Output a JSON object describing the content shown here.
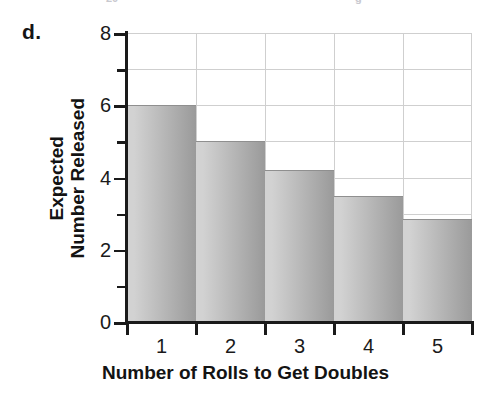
{
  "panel": {
    "label": "d."
  },
  "artifacts": {
    "left_fragment": "20",
    "right_fragment": "g"
  },
  "chart_data": {
    "type": "bar",
    "title": "",
    "subtitle": "",
    "categories": [
      "1",
      "2",
      "3",
      "4",
      "5"
    ],
    "values": [
      6.0,
      5.0,
      4.2,
      3.5,
      2.85
    ],
    "series": [
      {
        "name": "Expected Number Released",
        "values": [
          6.0,
          5.0,
          4.2,
          3.5,
          2.85
        ]
      }
    ],
    "xlabel": "Number of Rolls to Get Doubles",
    "ylabel": "Expected Number Released",
    "ylabel_lines": [
      "Expected",
      "Number Released"
    ],
    "ylim": [
      0,
      8
    ],
    "xlim": [
      0,
      5
    ],
    "y_major_ticks": [
      0,
      2,
      4,
      6,
      8
    ],
    "y_major_tick_labels": [
      "0",
      "2",
      "4",
      "6",
      "8"
    ],
    "y_minor_ticks": [
      1,
      3,
      5,
      7
    ],
    "gridlines": {
      "horizontal": [
        1,
        2,
        3,
        4,
        5,
        6,
        7,
        8
      ],
      "vertical": [
        1,
        2,
        3,
        4
      ],
      "visible": true,
      "color": "#cfcfcf"
    },
    "legend": {
      "visible": false,
      "position": "none",
      "entries": []
    },
    "bar_style": {
      "fill_light": "#d2d2d2",
      "fill_dark": "#9a9a9a",
      "edge_color": "#8f8f8f",
      "gap": 0
    },
    "axis_color": "#1a1a1a",
    "background": "#ffffff"
  }
}
